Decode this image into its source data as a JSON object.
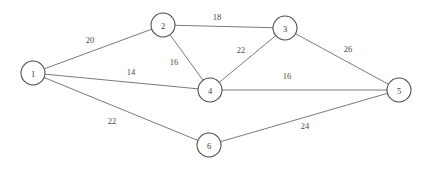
{
  "figure": {
    "type": "node-link-graph",
    "background_color": "#ffffff",
    "node_fill_color": "#ffffff",
    "node_stroke_color": "#4a4a4a",
    "edge_color": "#6b6b6b",
    "label_color": "#3a3a3a",
    "width": 432,
    "height": 169
  },
  "chart_data": {
    "type": "diagram",
    "title": "",
    "xlabel": "",
    "ylabel": "",
    "nodes": [
      {
        "id": "1",
        "label": "1",
        "x": 33,
        "y": 73,
        "r": 12
      },
      {
        "id": "2",
        "label": "2",
        "x": 163,
        "y": 25,
        "r": 12
      },
      {
        "id": "3",
        "label": "3",
        "x": 285,
        "y": 28,
        "r": 12
      },
      {
        "id": "4",
        "label": "4",
        "x": 210,
        "y": 90,
        "r": 12
      },
      {
        "id": "5",
        "label": "5",
        "x": 399,
        "y": 90,
        "r": 12
      },
      {
        "id": "6",
        "label": "6",
        "x": 209,
        "y": 145,
        "r": 12
      }
    ],
    "edges": [
      {
        "source": "1",
        "target": "2",
        "weight": "20",
        "label_x": 90,
        "label_y": 40
      },
      {
        "source": "2",
        "target": "3",
        "weight": "18",
        "label_x": 217,
        "label_y": 17
      },
      {
        "source": "2",
        "target": "4",
        "weight": "16",
        "label_x": 174,
        "label_y": 62
      },
      {
        "source": "3",
        "target": "4",
        "weight": "22",
        "label_x": 241,
        "label_y": 50
      },
      {
        "source": "1",
        "target": "4",
        "weight": "14",
        "label_x": 131,
        "label_y": 72
      },
      {
        "source": "3",
        "target": "5",
        "weight": "26",
        "label_x": 348,
        "label_y": 49
      },
      {
        "source": "4",
        "target": "5",
        "weight": "16",
        "label_x": 287,
        "label_y": 76
      },
      {
        "source": "1",
        "target": "6",
        "weight": "22",
        "label_x": 112,
        "label_y": 121
      },
      {
        "source": "6",
        "target": "5",
        "weight": "24",
        "label_x": 305,
        "label_y": 126
      }
    ]
  }
}
